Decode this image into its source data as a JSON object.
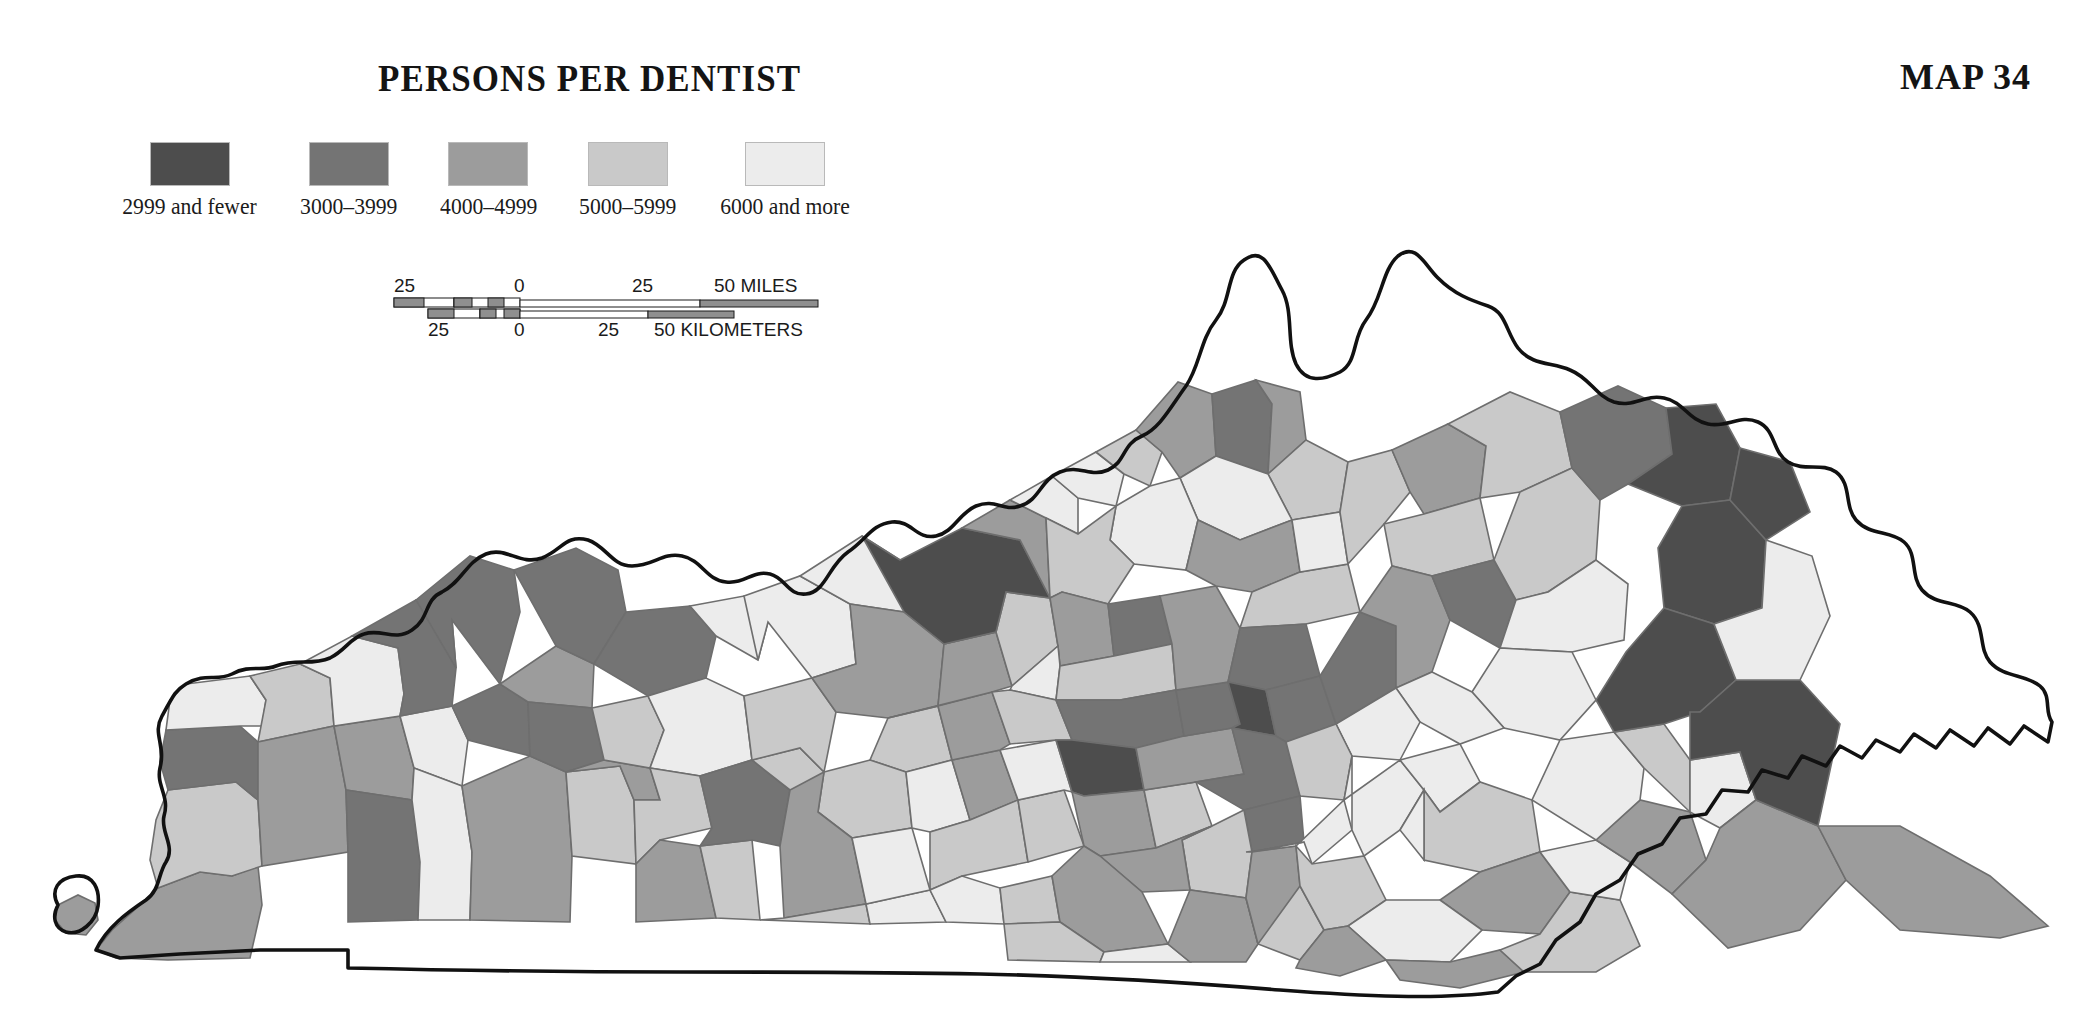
{
  "title": "PERSONS PER DENTIST",
  "map_number": "MAP 34",
  "background": "#ffffff",
  "legend": {
    "items": [
      {
        "label": "2999 and fewer",
        "color": "#4d4d4d",
        "class_index": 1
      },
      {
        "label": "3000–3999",
        "color": "#747474",
        "class_index": 2
      },
      {
        "label": "4000–4999",
        "color": "#9c9c9c",
        "class_index": 3
      },
      {
        "label": "5000–5999",
        "color": "#c9c9c9",
        "class_index": 4
      },
      {
        "label": "6000 and more",
        "color": "#ececec",
        "class_index": 5
      }
    ]
  },
  "scalebar": {
    "miles": {
      "ticks": [
        "25",
        "0",
        "25",
        "50"
      ],
      "unit_label": "50 MILES"
    },
    "kilometers": {
      "ticks": [
        "25",
        "0",
        "25",
        "50"
      ],
      "unit_label": "50 KILOMETERS"
    }
  },
  "chart_data": {
    "type": "choropleth",
    "title": "PERSONS PER DENTIST",
    "subtitle": "MAP 34",
    "region": "Kentucky counties",
    "variable": "Persons per dentist",
    "legend_position": "top-left",
    "classes": [
      {
        "label": "2999 and fewer",
        "min": 0,
        "max": 2999,
        "color": "#4d4d4d"
      },
      {
        "label": "3000–3999",
        "min": 3000,
        "max": 3999,
        "color": "#747474"
      },
      {
        "label": "4000–4999",
        "min": 4000,
        "max": 4999,
        "color": "#9c9c9c"
      },
      {
        "label": "5000–5999",
        "min": 5000,
        "max": 5999,
        "color": "#c9c9c9"
      },
      {
        "label": "6000 and more",
        "min": 6000,
        "max": null,
        "color": "#ececec"
      }
    ],
    "scale_bar_miles": [
      25,
      0,
      25,
      50
    ],
    "scale_bar_kilometers": [
      25,
      0,
      25,
      50
    ],
    "values": [
      {
        "id": "fulton",
        "class": 3
      },
      {
        "id": "hickman",
        "class": 4
      },
      {
        "id": "carlisle",
        "class": 2
      },
      {
        "id": "ballard",
        "class": 5
      },
      {
        "id": "mccracken",
        "class": 4
      },
      {
        "id": "graves",
        "class": 3
      },
      {
        "id": "marshall",
        "class": 3
      },
      {
        "id": "calloway",
        "class": 2
      },
      {
        "id": "livingston",
        "class": 5
      },
      {
        "id": "lyon",
        "class": 5
      },
      {
        "id": "trigg",
        "class": 5
      },
      {
        "id": "caldwell",
        "class": 2
      },
      {
        "id": "crittenden",
        "class": 2
      },
      {
        "id": "union",
        "class": 2
      },
      {
        "id": "webster",
        "class": 3
      },
      {
        "id": "hopkins",
        "class": 2
      },
      {
        "id": "christian",
        "class": 3
      },
      {
        "id": "todd",
        "class": 4
      },
      {
        "id": "muhlenberg",
        "class": 3
      },
      {
        "id": "mclean",
        "class": 4
      },
      {
        "id": "henderson",
        "class": 2
      },
      {
        "id": "daviess",
        "class": 2
      },
      {
        "id": "hancock",
        "class": 5
      },
      {
        "id": "ohio",
        "class": 5
      },
      {
        "id": "butler",
        "class": 4
      },
      {
        "id": "logan",
        "class": 3
      },
      {
        "id": "simpson",
        "class": 4
      },
      {
        "id": "warren",
        "class": 2
      },
      {
        "id": "edmonson",
        "class": 4
      },
      {
        "id": "grayson",
        "class": 4
      },
      {
        "id": "breckinridge",
        "class": 5
      },
      {
        "id": "meade",
        "class": 5
      },
      {
        "id": "hardin",
        "class": 3
      },
      {
        "id": "larue",
        "class": 4
      },
      {
        "id": "hart",
        "class": 4
      },
      {
        "id": "barren",
        "class": 3
      },
      {
        "id": "allen",
        "class": 4
      },
      {
        "id": "monroe",
        "class": 5
      },
      {
        "id": "metcalfe",
        "class": 5
      },
      {
        "id": "green",
        "class": 5
      },
      {
        "id": "taylor",
        "class": 3
      },
      {
        "id": "adair",
        "class": 4
      },
      {
        "id": "cumberland",
        "class": 5
      },
      {
        "id": "clinton",
        "class": 4
      },
      {
        "id": "russell",
        "class": 4
      },
      {
        "id": "casey",
        "class": 5
      },
      {
        "id": "marion",
        "class": 3
      },
      {
        "id": "nelson",
        "class": 3
      },
      {
        "id": "bullitt",
        "class": 4
      },
      {
        "id": "jefferson",
        "class": 1
      },
      {
        "id": "oldham",
        "class": 3
      },
      {
        "id": "trimble",
        "class": 5
      },
      {
        "id": "henry",
        "class": 4
      },
      {
        "id": "shelby",
        "class": 3
      },
      {
        "id": "spencer",
        "class": 5
      },
      {
        "id": "anderson",
        "class": 4
      },
      {
        "id": "washington",
        "class": 4
      },
      {
        "id": "mercer",
        "class": 2
      },
      {
        "id": "boyle",
        "class": 1
      },
      {
        "id": "lincoln",
        "class": 3
      },
      {
        "id": "garrard",
        "class": 4
      },
      {
        "id": "jessamine",
        "class": 3
      },
      {
        "id": "woodford",
        "class": 2
      },
      {
        "id": "franklin",
        "class": 2
      },
      {
        "id": "scott",
        "class": 3
      },
      {
        "id": "fayette",
        "class": 1
      },
      {
        "id": "madison",
        "class": 2
      },
      {
        "id": "clark",
        "class": 2
      },
      {
        "id": "bourbon",
        "class": 2
      },
      {
        "id": "harrison",
        "class": 3
      },
      {
        "id": "nicholas",
        "class": 4
      },
      {
        "id": "bath",
        "class": 3
      },
      {
        "id": "montgomery",
        "class": 2
      },
      {
        "id": "powell",
        "class": 5
      },
      {
        "id": "estill",
        "class": 4
      },
      {
        "id": "rockcastle",
        "class": 4
      },
      {
        "id": "pulaski",
        "class": 3
      },
      {
        "id": "wayne",
        "class": 4
      },
      {
        "id": "mccreary",
        "class": 5
      },
      {
        "id": "whitley",
        "class": 3
      },
      {
        "id": "knox",
        "class": 4
      },
      {
        "id": "laurel",
        "class": 3
      },
      {
        "id": "jackson",
        "class": 5
      },
      {
        "id": "clay",
        "class": 4
      },
      {
        "id": "owsley",
        "class": 5
      },
      {
        "id": "lee",
        "class": 5
      },
      {
        "id": "breathitt",
        "class": 4
      },
      {
        "id": "perry",
        "class": 3
      },
      {
        "id": "leslie",
        "class": 5
      },
      {
        "id": "bell",
        "class": 3
      },
      {
        "id": "harlan",
        "class": 3
      },
      {
        "id": "letcher",
        "class": 4
      },
      {
        "id": "knott",
        "class": 5
      },
      {
        "id": "pike",
        "class": 3
      },
      {
        "id": "floyd",
        "class": 3
      },
      {
        "id": "magoffin",
        "class": 5
      },
      {
        "id": "johnson",
        "class": 4
      },
      {
        "id": "martin",
        "class": 5
      },
      {
        "id": "lawrence",
        "class": 1
      },
      {
        "id": "boyd",
        "class": 1
      },
      {
        "id": "greenup",
        "class": 2
      },
      {
        "id": "carter",
        "class": 4
      },
      {
        "id": "elliott",
        "class": 5
      },
      {
        "id": "morgan",
        "class": 5
      },
      {
        "id": "menifee",
        "class": 5
      },
      {
        "id": "rowan",
        "class": 2
      },
      {
        "id": "fleming",
        "class": 4
      },
      {
        "id": "mason",
        "class": 3
      },
      {
        "id": "lewis",
        "class": 4
      },
      {
        "id": "robertson",
        "class": 5
      },
      {
        "id": "bracken",
        "class": 4
      },
      {
        "id": "pendleton",
        "class": 4
      },
      {
        "id": "grant",
        "class": 5
      },
      {
        "id": "owen",
        "class": 5
      },
      {
        "id": "gallatin",
        "class": 4
      },
      {
        "id": "carroll",
        "class": 5
      },
      {
        "id": "boone",
        "class": 3
      },
      {
        "id": "kenton",
        "class": 2
      },
      {
        "id": "campbell",
        "class": 3
      },
      {
        "id": "wolfe",
        "class": 5
      },
      {
        "id": "fulton_bend",
        "class": 3
      }
    ]
  }
}
